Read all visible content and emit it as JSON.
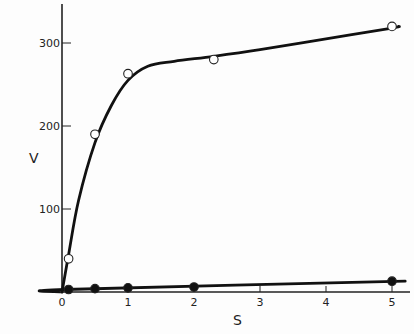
{
  "chart_data": {
    "type": "line",
    "title": "",
    "xlabel": "S",
    "ylabel": "V",
    "xlim": [
      0,
      5.3
    ],
    "ylim": [
      0,
      350
    ],
    "grid": false,
    "legend": null,
    "x_ticks": [
      "0",
      "1",
      "2",
      "3",
      "4",
      "5"
    ],
    "y_ticks": [
      "100",
      "200",
      "300"
    ],
    "series": [
      {
        "name": "open-circles",
        "marker": "open-circle",
        "x": [
          0.1,
          0.5,
          1.0,
          2.3,
          5.0
        ],
        "y": [
          40,
          190,
          263,
          280,
          320
        ],
        "fit_curve": [
          [
            0,
            0
          ],
          [
            0.1,
            45
          ],
          [
            0.25,
            110
          ],
          [
            0.5,
            180
          ],
          [
            0.75,
            225
          ],
          [
            1.0,
            255
          ],
          [
            1.3,
            272
          ],
          [
            1.7,
            278
          ],
          [
            2.3,
            284
          ],
          [
            3,
            292
          ],
          [
            4,
            305
          ],
          [
            5,
            318
          ],
          [
            5.1,
            320
          ]
        ]
      },
      {
        "name": "filled-circles",
        "marker": "filled-circle",
        "x": [
          0.1,
          0.5,
          1.0,
          2.0,
          5.0
        ],
        "y": [
          3,
          4,
          5,
          6,
          13
        ],
        "fit_curve": [
          [
            0,
            0
          ],
          [
            0.05,
            3
          ],
          [
            5.2,
            13
          ]
        ]
      }
    ]
  },
  "labels": {
    "x_axis": "S",
    "y_axis": "V",
    "origin": "0"
  }
}
